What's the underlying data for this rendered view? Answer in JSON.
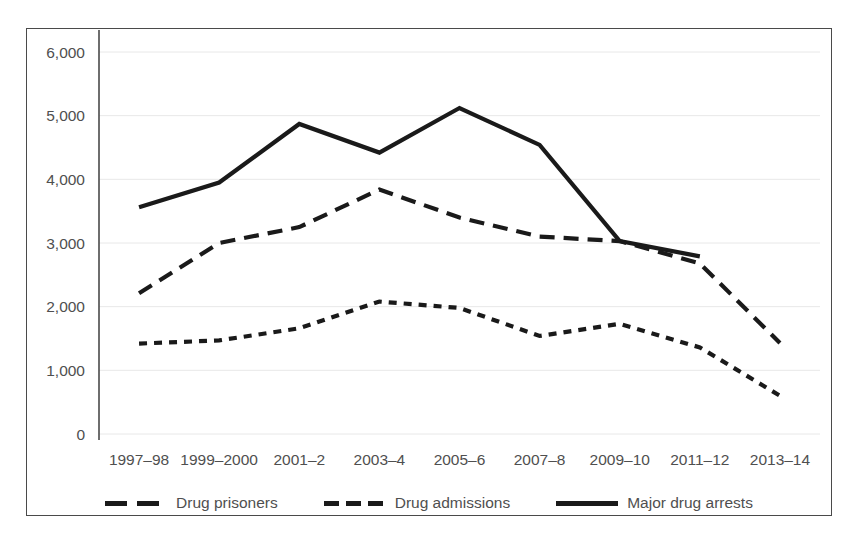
{
  "figure": {
    "background_color": "#ffffff",
    "frame_color": "#4a4a4a",
    "series_color": "#1a1a1a",
    "gridline_color": "#e8e8e8",
    "tick_label_color": "#4f4f4f"
  },
  "legend": {
    "position": "bottom-center",
    "entries": [
      {
        "label": "Drug prisoners",
        "marker": "long-dash-line",
        "marker_name": "legend-swatch-dashed"
      },
      {
        "label": "Drug admissions",
        "marker": "short-dash-line",
        "marker_name": "legend-swatch-dotted-dash"
      },
      {
        "label": "Major drug arrests",
        "marker": "solid-line",
        "marker_name": "legend-swatch-solid"
      }
    ]
  },
  "chart_data": {
    "type": "line",
    "title": "",
    "subtitle": "",
    "xlabel": "",
    "ylabel": "",
    "ylim": [
      0,
      6000
    ],
    "ytick_step": 1000,
    "ytick_labels": [
      "0",
      "1,000",
      "2,000",
      "3,000",
      "4,000",
      "5,000",
      "6,000"
    ],
    "ytick_values": [
      0,
      1000,
      2000,
      3000,
      4000,
      5000,
      6000
    ],
    "grid": "horizontal",
    "legend_position": "bottom",
    "categories": [
      "1997–98",
      "1999–2000",
      "2001–2",
      "2003–4",
      "2005–6",
      "2007–8",
      "2009–10",
      "2011–12",
      "2013–14"
    ],
    "series": [
      {
        "name": "Major drug arrests",
        "style": "solid",
        "values": [
          3560,
          3950,
          4870,
          4420,
          5120,
          4540,
          3030,
          2790,
          null
        ]
      },
      {
        "name": "Drug admissions",
        "style": "long-dash",
        "values": [
          2210,
          3000,
          3250,
          3840,
          3400,
          3100,
          3030,
          2680,
          1430
        ]
      },
      {
        "name": "Drug prisoners",
        "style": "short-dash",
        "values": [
          1420,
          1470,
          1660,
          2080,
          1980,
          1540,
          1730,
          1360,
          600
        ]
      }
    ]
  }
}
